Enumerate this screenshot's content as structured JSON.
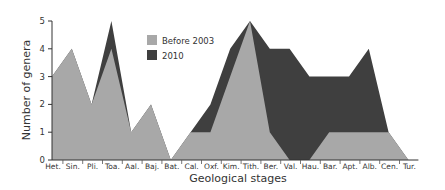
{
  "chart_data": {
    "type": "area",
    "stacked": false,
    "title": "",
    "xlabel": "Geological stages",
    "ylabel": "Number of genera",
    "ylim": [
      0,
      5
    ],
    "yticks": [
      0,
      1,
      2,
      3,
      4,
      5
    ],
    "grid": false,
    "legend_position": "upper-left-inside",
    "categories": [
      "Het.",
      "Sin.",
      "Pli.",
      "Toa.",
      "Aal.",
      "Baj.",
      "Bat.",
      "Cal.",
      "Oxf.",
      "Kim.",
      "Tith.",
      "Ber.",
      "Val.",
      "Hau.",
      "Bar.",
      "Apt.",
      "Alb.",
      "Cen.",
      "Tur."
    ],
    "series": [
      {
        "name": "2010",
        "color": "#3f3f3f",
        "values": [
          3,
          4,
          2,
          5,
          1,
          2,
          0,
          1,
          2,
          4,
          5,
          4,
          4,
          3,
          3,
          3,
          4,
          1,
          0
        ]
      },
      {
        "name": "Before 2003",
        "color": "#a8a8a8",
        "values": [
          3,
          4,
          2,
          4,
          1,
          2,
          0,
          1,
          1,
          3,
          5,
          1,
          0,
          0,
          1,
          1,
          1,
          1,
          0
        ]
      }
    ],
    "legend": [
      {
        "label": "Before 2003",
        "color": "#a8a8a8"
      },
      {
        "label": "2010",
        "color": "#3f3f3f"
      }
    ]
  }
}
